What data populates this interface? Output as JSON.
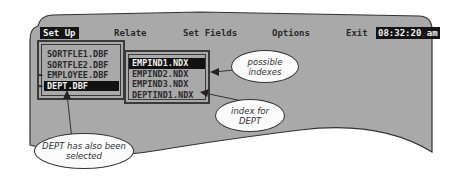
{
  "menu": {
    "items": [
      {
        "label": "Set Up",
        "active": true
      },
      {
        "label": "Relate",
        "active": false
      },
      {
        "label": "Set Fields",
        "active": false
      },
      {
        "label": "Options",
        "active": false
      },
      {
        "label": "Exit",
        "active": false
      }
    ],
    "clock": "08:32:20 am"
  },
  "files": [
    {
      "name": "SORTFLE1.DBF",
      "marked": false,
      "selected": false
    },
    {
      "name": "SORTFLE2.DBF",
      "marked": false,
      "selected": false
    },
    {
      "name": "EMPLOYEE.DBF",
      "marked": true,
      "selected": false
    },
    {
      "name": "DEPT.DBF",
      "marked": true,
      "selected": true
    }
  ],
  "indexes": [
    {
      "name": "EMPIND1.NDX",
      "selected": true
    },
    {
      "name": "EMPIND2.NDX",
      "selected": false
    },
    {
      "name": "EMPIND3.NDX",
      "selected": false
    },
    {
      "name": "DEPTIND1.NDX",
      "selected": false
    }
  ],
  "marker_glyph": "►",
  "callouts": {
    "possible_line1": "possible",
    "possible_line2": "indexes",
    "index_line1": "index for",
    "index_line2": "DEPT",
    "dept_line1": "DEPT has also been",
    "dept_line2": "selected"
  },
  "colors": {
    "screen": "#a9a9a9",
    "highlight": "#111111",
    "highlight_text": "#f2f2f2"
  }
}
